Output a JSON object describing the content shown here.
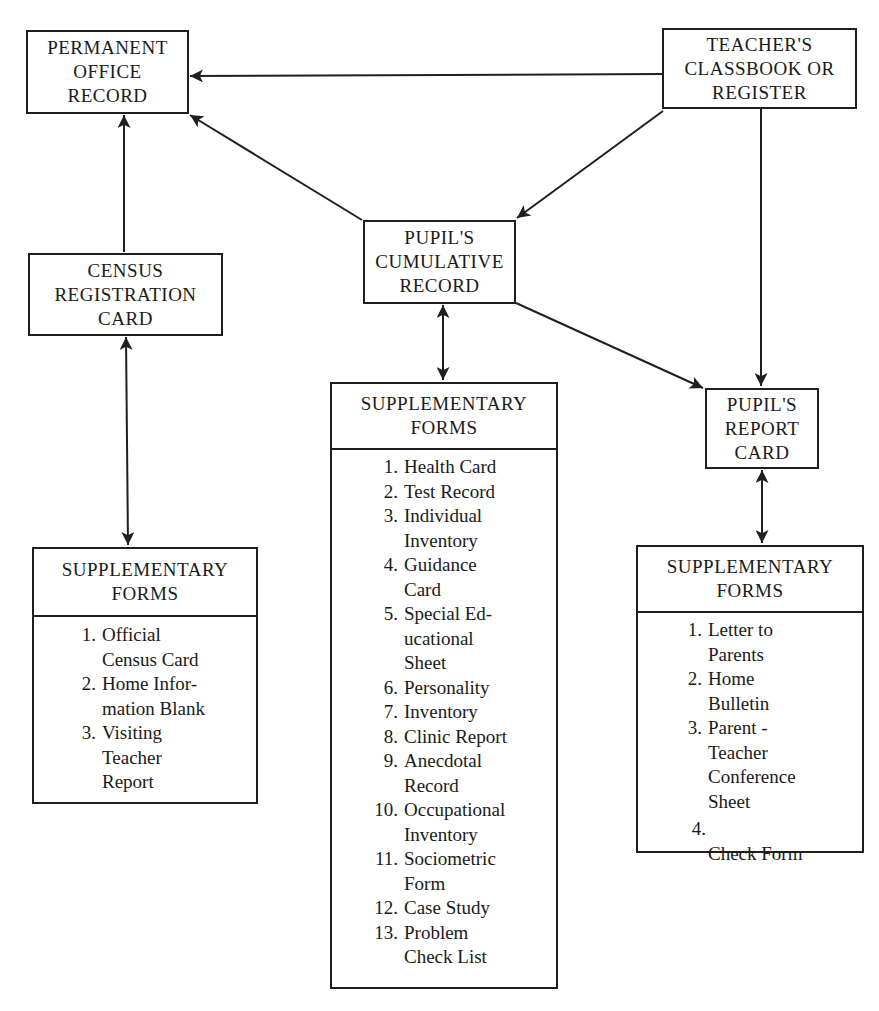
{
  "nodes": {
    "permanent_office_record": {
      "lines": [
        "PERMANENT",
        "OFFICE",
        "RECORD"
      ]
    },
    "teachers_classbook": {
      "lines": [
        "TEACHER'S",
        "CLASSBOOK OR",
        "REGISTER"
      ]
    },
    "pupils_cumulative_record": {
      "lines": [
        "PUPIL'S",
        "CUMULATIVE",
        "RECORD"
      ]
    },
    "census_registration_card": {
      "lines": [
        "CENSUS",
        "REGISTRATION",
        "CARD"
      ]
    },
    "pupils_report_card": {
      "lines": [
        "PUPIL'S",
        "REPORT",
        "CARD"
      ]
    }
  },
  "supplementary": {
    "census": {
      "title": [
        "SUPPLEMENTARY",
        "FORMS"
      ],
      "items": [
        {
          "num": "1.",
          "lines": [
            "Official",
            "Census Card"
          ]
        },
        {
          "num": "2.",
          "lines": [
            "Home Infor-",
            "mation Blank"
          ]
        },
        {
          "num": "3.",
          "lines": [
            "Visiting",
            "Teacher",
            "Report"
          ]
        }
      ]
    },
    "cumulative": {
      "title": [
        "SUPPLEMENTARY",
        "FORMS"
      ],
      "items": [
        {
          "num": "1.",
          "lines": [
            "Health Card"
          ]
        },
        {
          "num": "2.",
          "lines": [
            "Test Record"
          ]
        },
        {
          "num": "3.",
          "lines": [
            "Individual",
            "Inventory"
          ]
        },
        {
          "num": "4.",
          "lines": [
            "Guidance",
            "Card"
          ]
        },
        {
          "num": "5.",
          "lines": [
            "Special Ed-",
            "ucational",
            "Sheet"
          ]
        },
        {
          "num": "6.",
          "lines": [
            "Personality"
          ]
        },
        {
          "num": "7.",
          "lines": [
            "Inventory"
          ]
        },
        {
          "num": "8.",
          "lines": [
            "Clinic Report"
          ]
        },
        {
          "num": "9.",
          "lines": [
            "Anecdotal",
            "Record"
          ]
        },
        {
          "num": "10.",
          "lines": [
            "Occupational",
            "Inventory"
          ]
        },
        {
          "num": "11.",
          "lines": [
            "Sociometric",
            "Form"
          ]
        },
        {
          "num": "12.",
          "lines": [
            "Case Study"
          ]
        },
        {
          "num": "13.",
          "lines": [
            "Problem",
            "Check List"
          ]
        }
      ]
    },
    "report_card": {
      "title": [
        "SUPPLEMENTARY",
        "FORMS"
      ],
      "items": [
        {
          "num": "1.",
          "lines": [
            "Letter to",
            "Parents"
          ]
        },
        {
          "num": "2.",
          "lines": [
            "Home",
            "Bulletin"
          ]
        },
        {
          "num": "3.",
          "lines": [
            "Parent -",
            "Teacher",
            "Conference",
            "Sheet"
          ]
        },
        {
          "num": "4.",
          "lines": [
            "Check Form"
          ]
        }
      ]
    }
  },
  "edges": [
    {
      "from": "teachers_classbook",
      "to": "permanent_office_record",
      "type": "one-way"
    },
    {
      "from": "teachers_classbook",
      "to": "pupils_cumulative_record",
      "type": "one-way"
    },
    {
      "from": "teachers_classbook",
      "to": "pupils_report_card",
      "type": "one-way"
    },
    {
      "from": "pupils_cumulative_record",
      "to": "permanent_office_record",
      "type": "one-way"
    },
    {
      "from": "pupils_cumulative_record",
      "to": "pupils_report_card",
      "type": "one-way"
    },
    {
      "from": "census_registration_card",
      "to": "permanent_office_record",
      "type": "one-way"
    },
    {
      "from": "census_registration_card",
      "to": "census_supplementary_forms",
      "type": "two-way"
    },
    {
      "from": "pupils_cumulative_record",
      "to": "cumulative_supplementary_forms",
      "type": "two-way"
    },
    {
      "from": "pupils_report_card",
      "to": "report_card_supplementary_forms",
      "type": "two-way"
    }
  ]
}
